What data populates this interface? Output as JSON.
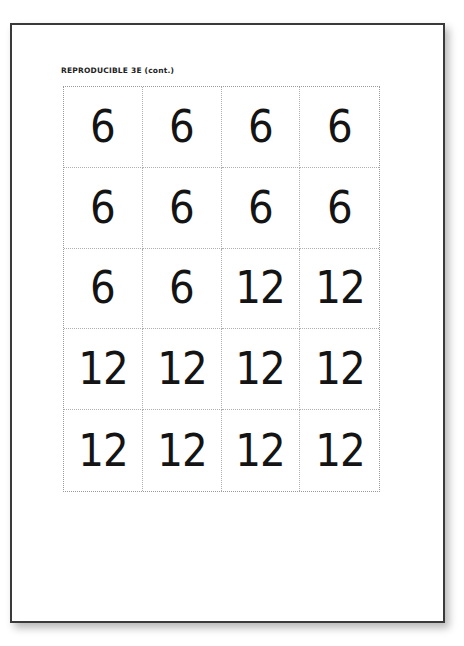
{
  "document": {
    "header": "REPRODUCIBLE 3E (cont.)",
    "cards": [
      [
        "6",
        "6",
        "6",
        "6"
      ],
      [
        "6",
        "6",
        "6",
        "6"
      ],
      [
        "6",
        "6",
        "12",
        "12"
      ],
      [
        "12",
        "12",
        "12",
        "12"
      ],
      [
        "12",
        "12",
        "12",
        "12"
      ]
    ]
  }
}
